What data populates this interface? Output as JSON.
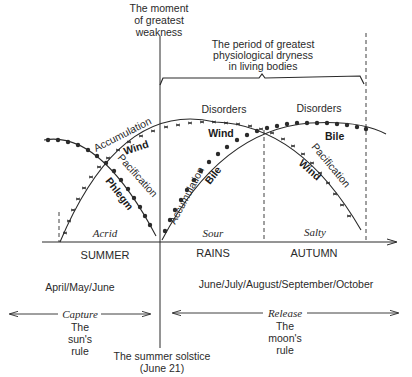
{
  "header": {
    "weakness_line1": "The moment",
    "weakness_line2": "of greatest",
    "weakness_line3": "weakness",
    "dryness_line1": "The period of greatest",
    "dryness_line2": "physiological dryness",
    "dryness_line3": "in living bodies"
  },
  "curves": {
    "disorders_1": "Disorders",
    "disorders_2": "Disorders",
    "wind_accumulation": "Accumulation",
    "wind_label_1": "Wind",
    "wind_label_2": "Wind",
    "wind_label_3": "Wind",
    "wind_pacification": "Pacification",
    "phlegm_pacification": "Pacification",
    "phlegm_label": "Phlegm",
    "bile_accumulation": "Accumulation",
    "bile_label_1": "Bile",
    "bile_label_2": "Bile"
  },
  "tastes": {
    "acrid": "Acrid",
    "sour": "Sour",
    "salty": "Salty"
  },
  "seasons": {
    "summer": "SUMMER",
    "rains": "RAINS",
    "autumn": "AUTUMN"
  },
  "months": {
    "summer": "April/May/June",
    "rains_autumn": "June/July/August/September/October"
  },
  "phases": {
    "capture": "Capture",
    "capture_line1": "The",
    "capture_line2": "sun's",
    "capture_line3": "rule",
    "release": "Release",
    "release_line1": "The",
    "release_line2": "moon's",
    "release_line3": "rule"
  },
  "footer": {
    "solstice_line1": "The summer solstice",
    "solstice_line2": "(June 21)"
  },
  "colors": {
    "ink": "#2a2a2a",
    "background": "#ffffff"
  }
}
